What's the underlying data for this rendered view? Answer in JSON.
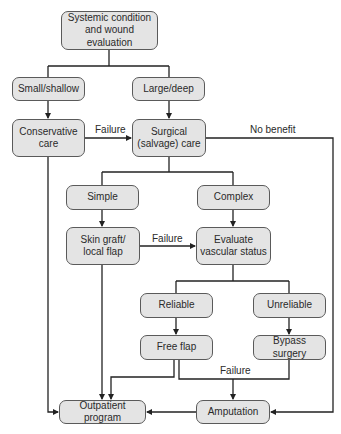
{
  "diagram": {
    "type": "flowchart",
    "nodes": {
      "systemic": "Systemic condition\nand wound evaluation",
      "small": "Small/shallow",
      "large": "Large/deep",
      "conservative": "Conservative\ncare",
      "surgical": "Surgical\n(salvage) care",
      "simple": "Simple",
      "complex": "Complex",
      "skin_graft": "Skin graft/\nlocal flap",
      "evaluate": "Evaluate\nvascular status",
      "reliable": "Reliable",
      "unreliable": "Unreliable",
      "free_flap": "Free flap",
      "bypass": "Bypass surgery",
      "outpatient": "Outpatient program",
      "amputation": "Amputation"
    },
    "edge_labels": {
      "failure_conservative": "Failure",
      "no_benefit": "No benefit",
      "failure_skin_graft": "Failure",
      "failure_free_flap": "Failure"
    },
    "colors": {
      "node_fill": "#e4e4e4",
      "node_border": "#5a5a5a",
      "line": "#222222"
    }
  }
}
